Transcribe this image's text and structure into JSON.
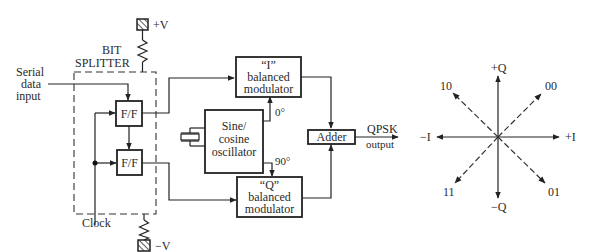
{
  "diagram": {
    "supply": {
      "positive_label": "+V",
      "negative_label": "−V"
    },
    "bit_splitter": {
      "label_line1": "BIT",
      "label_line2": "SPLITTER",
      "flipflop_top": "F/F",
      "flipflop_bottom": "F/F"
    },
    "serial_input": {
      "line1": "Serial",
      "line2": "data",
      "line3": "input"
    },
    "clock_label": "Clock",
    "oscillator": {
      "line1": "Sine/",
      "line2": "cosine",
      "line3": "oscillator",
      "phase_i": "0°",
      "phase_q": "90°"
    },
    "i_modulator": {
      "line1": "“I”",
      "line2": "balanced",
      "line3": "modulator"
    },
    "q_modulator": {
      "line1": "“Q”",
      "line2": "balanced",
      "line3": "modulator"
    },
    "adder": {
      "label": "Adder"
    },
    "output": {
      "line1": "QPSK",
      "line2": "output"
    },
    "phasor": {
      "axes": {
        "plus_q": "+Q",
        "minus_q": "−Q",
        "plus_i": "+I",
        "minus_i": "−I"
      },
      "symbols": [
        {
          "bits": "00",
          "position": "upper-right"
        },
        {
          "bits": "10",
          "position": "upper-left"
        },
        {
          "bits": "11",
          "position": "lower-left"
        },
        {
          "bits": "01",
          "position": "lower-right"
        }
      ]
    }
  }
}
